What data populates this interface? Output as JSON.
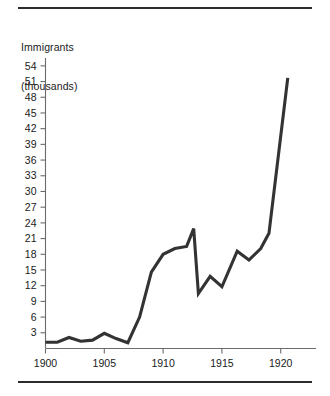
{
  "figure": {
    "top_rule": "",
    "bottom_rule": ""
  },
  "chart_data": {
    "type": "line",
    "title": "",
    "subtitle": "",
    "xlabel": "",
    "ylabel": "Immigrants",
    "ylabel_line1": "Immigrants",
    "ylabel_line2": "(thousands)",
    "ylabel_units": "thousands",
    "xlim": [
      1900,
      1923
    ],
    "ylim": [
      0,
      55.5
    ],
    "grid": false,
    "legend": null,
    "legend_position": "none",
    "yticks": [
      3,
      6,
      9,
      12,
      15,
      18,
      21,
      24,
      27,
      30,
      33,
      36,
      39,
      42,
      45,
      48,
      51,
      54
    ],
    "ytick_labels": [
      "3",
      "6",
      "9",
      "12",
      "15",
      "18",
      "21",
      "24",
      "27",
      "30",
      "33",
      "36",
      "39",
      "42",
      "45",
      "48",
      "51",
      "54"
    ],
    "xticks": [
      1900,
      1905,
      1910,
      1915,
      1920
    ],
    "xtick_labels": [
      "1900",
      "1905",
      "1910",
      "1915",
      "1920"
    ],
    "series": [
      {
        "name": "Immigrants",
        "color": "#333333",
        "x": [
          1900,
          1901,
          1902,
          1903,
          1904,
          1905,
          1906,
          1907,
          1908,
          1909,
          1910,
          1911,
          1912,
          1912.6,
          1913,
          1914,
          1915,
          1916.3,
          1917.3,
          1918.3,
          1919,
          1920.6
        ],
        "values": [
          1.2,
          1.2,
          2.1,
          1.4,
          1.6,
          2.9,
          1.9,
          1.1,
          6.0,
          14.6,
          18.0,
          19.1,
          19.5,
          22.9,
          10.5,
          13.8,
          11.8,
          18.6,
          16.9,
          19.1,
          22.0,
          51.7
        ]
      }
    ]
  }
}
